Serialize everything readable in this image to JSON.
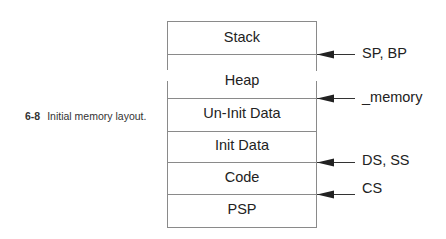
{
  "caption": {
    "number": "6-8",
    "text": "Initial memory layout."
  },
  "segments": [
    {
      "label": "Stack"
    },
    {
      "label": "Heap"
    },
    {
      "label": "Un-Init Data"
    },
    {
      "label": "Init Data"
    },
    {
      "label": "Code"
    },
    {
      "label": "PSP"
    }
  ],
  "pointers": [
    {
      "label": "SP, BP"
    },
    {
      "label": "_memory"
    },
    {
      "label": "DS, SS"
    },
    {
      "label": "CS"
    }
  ],
  "colors": {
    "line": "#8a8a8a",
    "arrow": "#222222"
  }
}
